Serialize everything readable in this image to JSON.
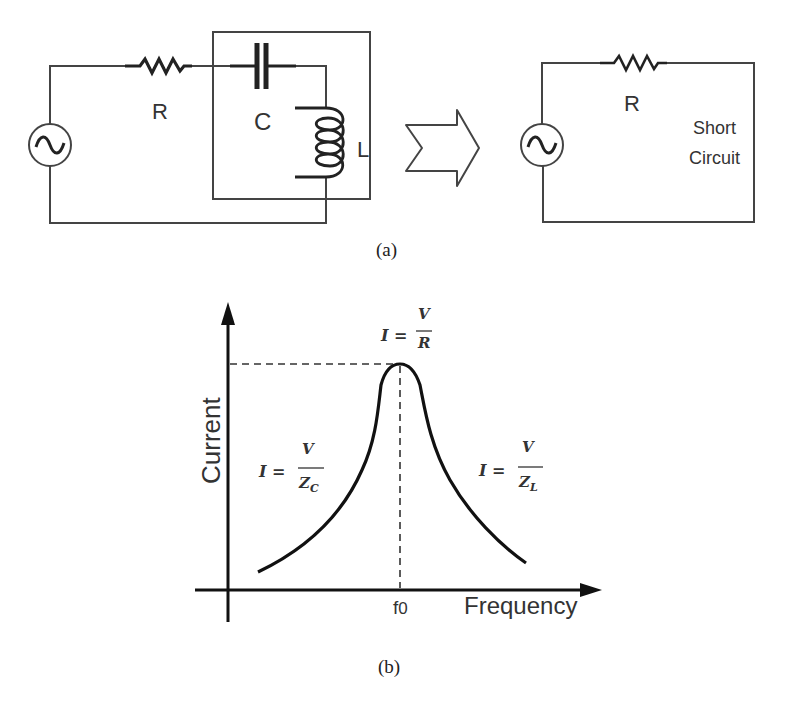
{
  "figure": {
    "panel_a": {
      "caption": "(a)",
      "left_circuit": {
        "resistor_label": "R",
        "capacitor_label": "C",
        "inductor_label": "L",
        "source_symbol": "ac-source"
      },
      "arrow": "transform-arrow",
      "right_circuit": {
        "resistor_label": "R",
        "short_label_line1": "Short",
        "short_label_line2": "Circuit",
        "source_symbol": "ac-source"
      }
    },
    "panel_b": {
      "caption": "(b)",
      "y_axis_label": "Current",
      "x_axis_label": "Frequency",
      "resonant_tick_label": "f",
      "resonant_tick_sub": "0",
      "peak_eq": {
        "lhs": "I =",
        "num": "V",
        "den": "R"
      },
      "left_eq": {
        "lhs": "I =",
        "num": "V",
        "den": "Z",
        "den_sub": "C"
      },
      "right_eq": {
        "lhs": "I =",
        "num": "V",
        "den": "Z",
        "den_sub": "L"
      }
    }
  },
  "colors": {
    "line": "#222222",
    "wire": "#444444",
    "text": "#333333",
    "background": "#ffffff"
  }
}
